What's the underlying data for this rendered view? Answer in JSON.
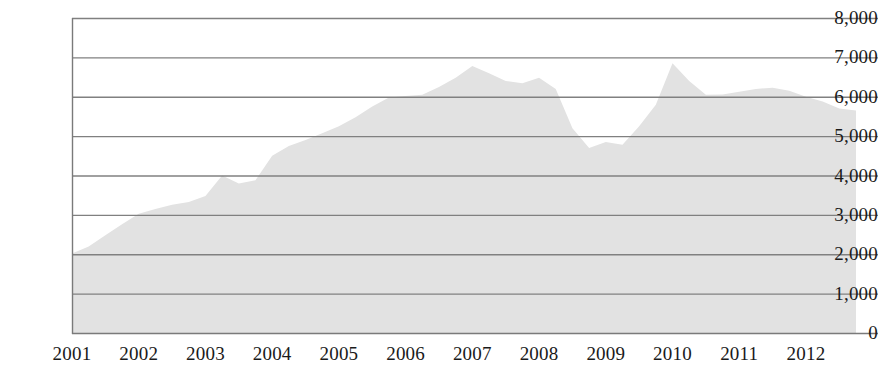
{
  "chart_data": {
    "type": "area",
    "title": "",
    "subtitle": "",
    "xlabel": "",
    "ylabel": "",
    "xlim": [
      2001,
      2012.75
    ],
    "ylim": [
      0,
      8000
    ],
    "grid": true,
    "legend": null,
    "fill_color": "#e2e2e2",
    "grid_color": "#808080",
    "axis_color": "#7a7a7a",
    "text_color": "#1a1a1a",
    "y_ticks": [
      0,
      1000,
      2000,
      3000,
      4000,
      5000,
      6000,
      7000,
      8000
    ],
    "y_tick_labels": [
      "0",
      "1,000",
      "2,000",
      "3,000",
      "4,000",
      "5,000",
      "6,000",
      "7,000",
      "8,000"
    ],
    "x_ticks": [
      2001,
      2002,
      2003,
      2004,
      2005,
      2006,
      2007,
      2008,
      2009,
      2010,
      2011,
      2012
    ],
    "x_tick_labels": [
      "2001",
      "2002",
      "2003",
      "2004",
      "2005",
      "2006",
      "2007",
      "2008",
      "2009",
      "2010",
      "2011",
      "2012"
    ],
    "x": [
      2001.0,
      2001.25,
      2001.5,
      2001.75,
      2002.0,
      2002.25,
      2002.5,
      2002.75,
      2003.0,
      2003.25,
      2003.5,
      2003.75,
      2004.0,
      2004.25,
      2004.5,
      2004.75,
      2005.0,
      2005.25,
      2005.5,
      2005.75,
      2006.0,
      2006.25,
      2006.5,
      2006.75,
      2007.0,
      2007.25,
      2007.5,
      2007.75,
      2008.0,
      2008.25,
      2008.5,
      2008.75,
      2009.0,
      2009.25,
      2009.5,
      2009.75,
      2010.0,
      2010.25,
      2010.5,
      2010.75,
      2011.0,
      2011.25,
      2011.5,
      2011.75,
      2012.0,
      2012.25,
      2012.5,
      2012.75
    ],
    "values": [
      2020,
      2200,
      2480,
      2760,
      3030,
      3150,
      3260,
      3330,
      3480,
      4000,
      3800,
      3880,
      4500,
      4750,
      4900,
      5070,
      5250,
      5480,
      5750,
      5980,
      6020,
      6050,
      6250,
      6480,
      6780,
      6600,
      6400,
      6340,
      6480,
      6200,
      5200,
      4700,
      4850,
      4780,
      5250,
      5800,
      6850,
      6400,
      6050,
      6060,
      6130,
      6200,
      6230,
      6150,
      6000,
      5880,
      5700,
      5650
    ],
    "annotations": []
  },
  "plot": {
    "left_px": 72,
    "right_px": 856,
    "top_px": 18,
    "bottom_px": 333
  }
}
